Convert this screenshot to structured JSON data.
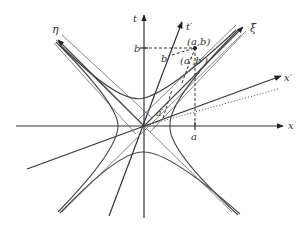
{
  "diagram": {
    "type": "spacetime-minkowski-diagram",
    "labels": {
      "t_axis": "t",
      "x_axis": "x",
      "t_prime_axis": "t′",
      "x_prime_axis": "x′",
      "xi_axis": "ξ",
      "eta_axis": "η",
      "b": "b",
      "a": "a",
      "b_prime": "b′",
      "a_prime": "a′",
      "point_ab": "(a,b)",
      "point_ab_prime": "(a′,b′)"
    },
    "colors": {
      "line": "#333333",
      "background": "#ffffff"
    }
  }
}
